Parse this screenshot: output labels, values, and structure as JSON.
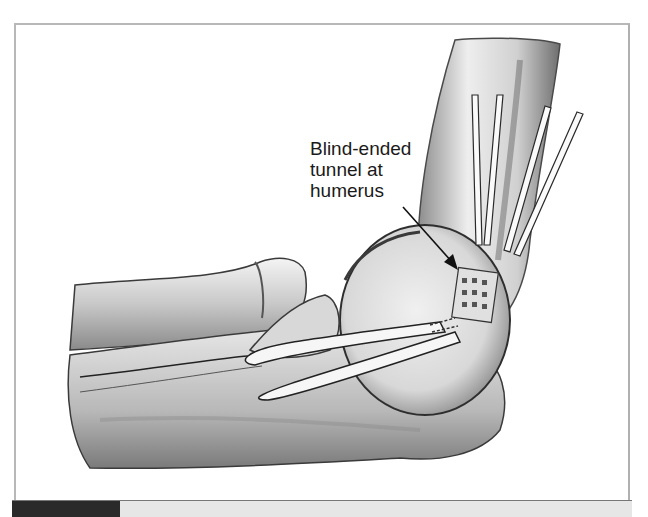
{
  "figure": {
    "annotation_label": "Blind-ended\ntunnel at\nhumerus",
    "annotation_lines": [
      "Blind-ended",
      "tunnel at",
      "humerus"
    ]
  },
  "colors": {
    "bone_light": "#f2f2f2",
    "bone_shade": "#9a9a9a",
    "outline": "#2a2a2a",
    "caption_tab": "#2a2a2a",
    "caption_bar": "#e6e6e6"
  }
}
